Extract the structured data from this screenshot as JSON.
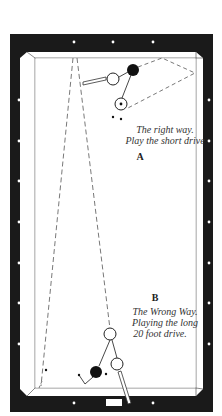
{
  "figure": {
    "type": "billiards-table-diagram",
    "colors": {
      "rail": "#1a1a1a",
      "cloth": "#ffffff",
      "diamond": "#ffffff",
      "line": "#333333",
      "dashed": "#555555",
      "object_ball": "#111111"
    }
  },
  "section_a": {
    "label": "A",
    "caption_line1": "The right way.",
    "caption_line2": "Play the short drive"
  },
  "section_b": {
    "label": "B",
    "caption_line1": "The Wrong Way.",
    "caption_line2": "Playing the long",
    "caption_line3": "20 foot drive."
  }
}
